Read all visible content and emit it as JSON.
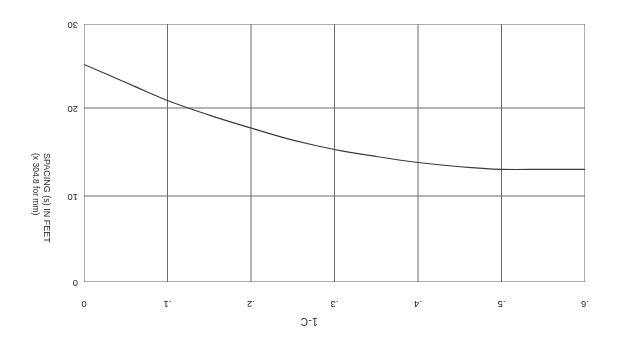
{
  "figure": {
    "title": "1-C",
    "rotation_note": "180"
  },
  "axes": {
    "x": {
      "label": "",
      "ticks": [
        ".6",
        ".5",
        ".4",
        ".3",
        ".2",
        ".1",
        "0"
      ],
      "values": [
        0.6,
        0.5,
        0.4,
        0.3,
        0.2,
        0.1,
        0.0
      ],
      "min": 0.0,
      "max": 0.6,
      "direction": "right-to-left"
    },
    "y": {
      "label_line1": "SPACING (s) IN FEET",
      "label_line2": "(x 304.8 for mm)",
      "ticks": [
        "0",
        "10",
        "20",
        "30"
      ],
      "values": [
        0,
        10,
        20,
        30
      ],
      "min": 0,
      "max": 30,
      "direction": "top-to-bottom"
    }
  },
  "style": {
    "grid_color": "#6b6b6b",
    "axis_color": "#4a4a4a",
    "curve_color": "#3a3a3a",
    "background": "#ffffff"
  },
  "chart_data": {
    "type": "line",
    "title": "1-C",
    "xlabel": "",
    "ylabel": "SPACING (s) IN FEET (x 304.8 for mm)",
    "xlim": [
      0.0,
      0.6
    ],
    "ylim": [
      0,
      30
    ],
    "x_ticks": [
      0.0,
      0.1,
      0.2,
      0.3,
      0.4,
      0.5,
      0.6
    ],
    "y_ticks": [
      0,
      10,
      20,
      30
    ],
    "grid": true,
    "legend": "none",
    "x_axis_position": "top",
    "y_axis_position": "right",
    "x_axis_inverted": true,
    "series": [
      {
        "name": "spacing curve",
        "x": [
          0.6,
          0.55,
          0.5,
          0.45,
          0.4,
          0.35,
          0.3,
          0.25,
          0.2,
          0.15,
          0.1,
          0.05,
          0.0
        ],
        "y": [
          13.1,
          13.1,
          13.1,
          13.4,
          13.9,
          14.6,
          15.4,
          16.5,
          17.9,
          19.4,
          21.1,
          23.2,
          25.3
        ]
      }
    ],
    "annotations": [
      {
        "text": "",
        "kind": "end-tick-dash",
        "x": 0.0,
        "y": 25.3
      }
    ]
  }
}
